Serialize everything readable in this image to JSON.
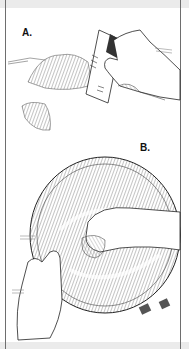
{
  "figure": {
    "panels": [
      {
        "label": "A.",
        "description": "Hand scraping residue with a plastic card"
      },
      {
        "label": "B.",
        "description": "Hands wiping inside of a metal bowl"
      }
    ],
    "colors": {
      "ink": "#1a1a1a",
      "hatch": "#555555",
      "band": "#ebebeb",
      "border": "#6e6e6e"
    }
  }
}
